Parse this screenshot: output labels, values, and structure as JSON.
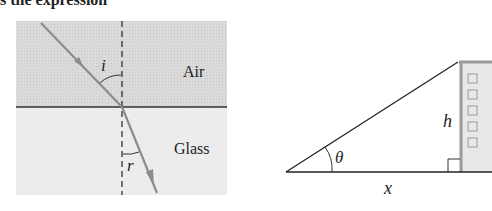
{
  "top_text": "s the expression",
  "refraction_diagram": {
    "regions": [
      {
        "label": "Air",
        "fill": "#dcdcdc"
      },
      {
        "label": "Glass",
        "fill": "#ececec"
      }
    ],
    "angle_incidence_label": "i",
    "angle_refraction_label": "r",
    "ray_color": "#8c8c8c"
  },
  "triangle_diagram": {
    "angle_label": "θ",
    "height_label": "h",
    "base_label": "x",
    "building_fill": "#e6e6e6",
    "building_edge": "#9a9a9a",
    "window_count": 5
  }
}
